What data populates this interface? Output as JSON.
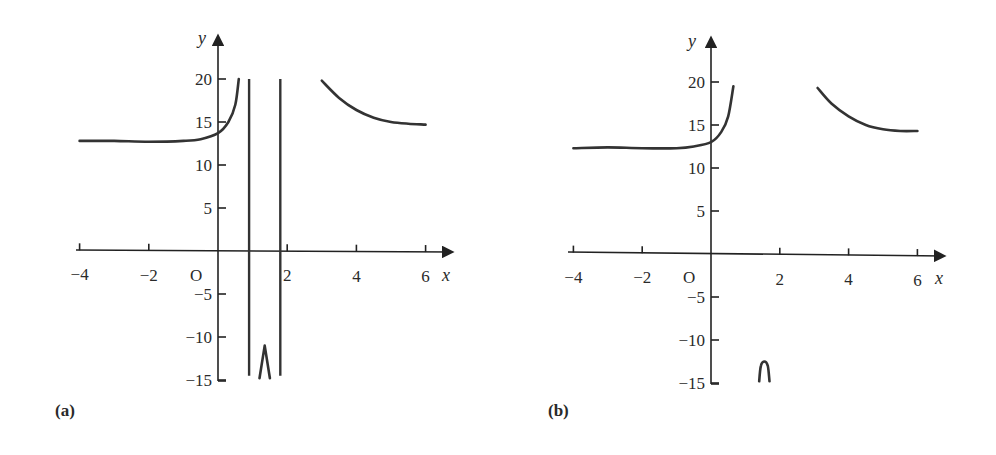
{
  "chart_data": [
    {
      "panel": "(a)",
      "type": "line",
      "title": "",
      "xlabel": "x",
      "ylabel": "y",
      "origin_label": "O",
      "xlim": [
        -4,
        6.5
      ],
      "ylim": [
        -15,
        22
      ],
      "x_ticks": [
        -4,
        -2,
        2,
        4,
        6
      ],
      "x_tick_labels": [
        "−4",
        "−2",
        "2",
        "4",
        "6"
      ],
      "y_ticks": [
        20,
        15,
        10,
        5,
        -5,
        -10,
        -15
      ],
      "y_tick_labels": [
        "20",
        "15",
        "10",
        "5",
        "−5",
        "−10",
        "−15"
      ],
      "grid": false,
      "series": [
        {
          "name": "left branch",
          "points": [
            [
              -4,
              12.8
            ],
            [
              -3,
              12.8
            ],
            [
              -2,
              12.7
            ],
            [
              -1,
              12.8
            ],
            [
              -0.5,
              13.0
            ],
            [
              0,
              13.7
            ],
            [
              0.3,
              15.0
            ],
            [
              0.5,
              17.0
            ],
            [
              0.6,
              20.0
            ]
          ]
        },
        {
          "name": "vertical line 1",
          "points": [
            [
              0.9,
              20
            ],
            [
              0.9,
              -14.5
            ]
          ]
        },
        {
          "name": "vertical line 2",
          "points": [
            [
              1.8,
              20
            ],
            [
              1.8,
              -14.5
            ]
          ]
        },
        {
          "name": "middle spike",
          "points": [
            [
              1.2,
              -14.8
            ],
            [
              1.35,
              -11.0
            ],
            [
              1.5,
              -14.8
            ]
          ]
        },
        {
          "name": "right branch",
          "points": [
            [
              3.0,
              19.8
            ],
            [
              3.5,
              17.8
            ],
            [
              4.0,
              16.4
            ],
            [
              4.5,
              15.5
            ],
            [
              5.0,
              15.0
            ],
            [
              5.5,
              14.8
            ],
            [
              6.0,
              14.7
            ]
          ]
        }
      ]
    },
    {
      "panel": "(b)",
      "type": "line",
      "title": "",
      "xlabel": "x",
      "ylabel": "y",
      "origin_label": "O",
      "xlim": [
        -4,
        6.5
      ],
      "ylim": [
        -15,
        22
      ],
      "x_ticks": [
        -4,
        -2,
        2,
        4,
        6
      ],
      "x_tick_labels": [
        "−4",
        "−2",
        "2",
        "4",
        "6"
      ],
      "y_ticks": [
        20,
        15,
        10,
        5,
        -5,
        -10,
        -15
      ],
      "y_tick_labels": [
        "20",
        "15",
        "10",
        "5",
        "−5",
        "−10",
        "−15"
      ],
      "grid": false,
      "series": [
        {
          "name": "left branch",
          "points": [
            [
              -4,
              12.3
            ],
            [
              -3,
              12.4
            ],
            [
              -2,
              12.3
            ],
            [
              -1,
              12.3
            ],
            [
              -0.5,
              12.5
            ],
            [
              0,
              13.0
            ],
            [
              0.3,
              14.2
            ],
            [
              0.5,
              16.0
            ],
            [
              0.65,
              19.5
            ]
          ]
        },
        {
          "name": "middle cap",
          "points": [
            [
              1.4,
              -14.8
            ],
            [
              1.45,
              -13.0
            ],
            [
              1.55,
              -12.5
            ],
            [
              1.65,
              -13.0
            ],
            [
              1.7,
              -14.8
            ]
          ]
        },
        {
          "name": "right branch",
          "points": [
            [
              3.1,
              19.3
            ],
            [
              3.5,
              17.5
            ],
            [
              4.0,
              16.0
            ],
            [
              4.5,
              15.0
            ],
            [
              5.0,
              14.5
            ],
            [
              5.5,
              14.3
            ],
            [
              6.0,
              14.3
            ]
          ]
        }
      ]
    }
  ]
}
